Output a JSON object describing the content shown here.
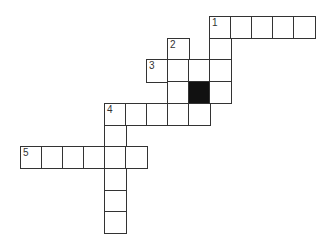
{
  "puzzle": {
    "type": "crossword",
    "grid": {
      "origin_x": 20,
      "origin_y": 16,
      "cell_w": 21,
      "cell_h": 21.7,
      "line_color": "#333333",
      "block_color": "#111111"
    },
    "cells": [
      {
        "r": 0,
        "c": 9,
        "num": "1"
      },
      {
        "r": 0,
        "c": 10
      },
      {
        "r": 0,
        "c": 11
      },
      {
        "r": 0,
        "c": 12
      },
      {
        "r": 0,
        "c": 13
      },
      {
        "r": 1,
        "c": 7,
        "num": "2"
      },
      {
        "r": 1,
        "c": 9
      },
      {
        "r": 2,
        "c": 6,
        "num": "3"
      },
      {
        "r": 2,
        "c": 7
      },
      {
        "r": 2,
        "c": 8
      },
      {
        "r": 2,
        "c": 9
      },
      {
        "r": 3,
        "c": 7
      },
      {
        "r": 3,
        "c": 8,
        "block": true
      },
      {
        "r": 3,
        "c": 9
      },
      {
        "r": 4,
        "c": 4,
        "num": "4"
      },
      {
        "r": 4,
        "c": 5
      },
      {
        "r": 4,
        "c": 6
      },
      {
        "r": 4,
        "c": 7
      },
      {
        "r": 4,
        "c": 8
      },
      {
        "r": 5,
        "c": 4
      },
      {
        "r": 6,
        "c": 0,
        "num": "5"
      },
      {
        "r": 6,
        "c": 1
      },
      {
        "r": 6,
        "c": 2
      },
      {
        "r": 6,
        "c": 3
      },
      {
        "r": 6,
        "c": 4
      },
      {
        "r": 6,
        "c": 5
      },
      {
        "r": 7,
        "c": 4
      },
      {
        "r": 8,
        "c": 4
      },
      {
        "r": 9,
        "c": 4
      }
    ],
    "clue_numbers": [
      "1",
      "2",
      "3",
      "4",
      "5"
    ]
  }
}
